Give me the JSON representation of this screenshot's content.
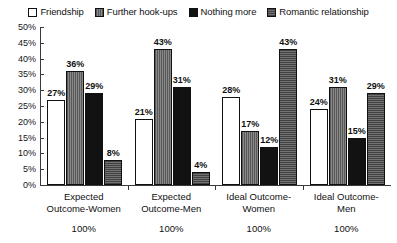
{
  "chart_data": {
    "type": "bar",
    "title": "",
    "subtitle": "",
    "xlabel": "",
    "ylabel": "",
    "ylim": [
      0,
      50
    ],
    "ytick_step": 5,
    "ytick_labels": [
      "50%",
      "45%",
      "40%",
      "35%",
      "30%",
      "25%",
      "20%",
      "15%",
      "10%",
      "5%",
      "0%"
    ],
    "ytick_values": [
      50,
      45,
      40,
      35,
      30,
      25,
      20,
      15,
      10,
      5,
      0
    ],
    "grid": false,
    "legend_position": "top",
    "value_label_suffix": "%",
    "categories": [
      "Expected Outcome-Women",
      "Expected Outcome-Men",
      "Ideal Outcome-Women",
      "Ideal Outcome-Men"
    ],
    "category_lines": [
      [
        "Expected",
        "Outcome-Women"
      ],
      [
        "Expected",
        "Outcome-Men"
      ],
      [
        "Ideal Outcome-",
        "Women"
      ],
      [
        "Ideal Outcome-",
        "Men"
      ]
    ],
    "category_totals": [
      "100%",
      "100%",
      "100%",
      "100%"
    ],
    "series": [
      {
        "name": "Friendship",
        "fill": "white",
        "color": "#ffffff",
        "values": [
          27,
          21,
          28,
          24
        ],
        "labels": [
          "27%",
          "21%",
          "28%",
          "24%"
        ]
      },
      {
        "name": "Further hook-ups",
        "fill": "gray-vertical-lines",
        "color": "#777777",
        "values": [
          36,
          43,
          17,
          31
        ],
        "labels": [
          "36%",
          "43%",
          "17%",
          "31%"
        ]
      },
      {
        "name": "Nothing more",
        "fill": "solid-black",
        "color": "#121212",
        "values": [
          29,
          31,
          12,
          15
        ],
        "labels": [
          "29%",
          "31%",
          "12%",
          "15%"
        ]
      },
      {
        "name": "Romantic relationship",
        "fill": "dark-gray-horizontal-lines",
        "color": "#5f5f5f",
        "values": [
          8,
          4,
          43,
          29
        ],
        "labels": [
          "8%",
          "4%",
          "43%",
          "29%"
        ]
      }
    ]
  }
}
